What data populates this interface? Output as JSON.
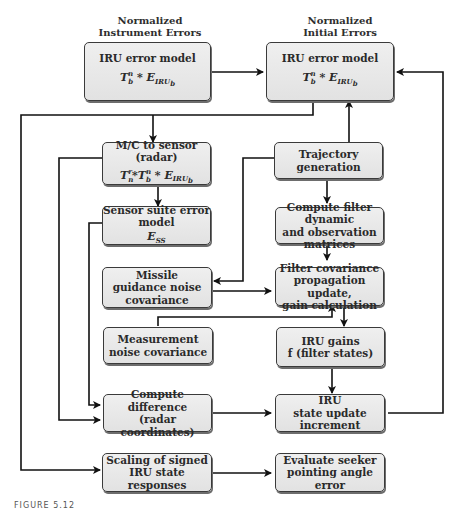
{
  "headers": {
    "left": [
      "Normalized",
      "Instrument Errors"
    ],
    "right": [
      "Normalized",
      "Initial Errors"
    ]
  },
  "boxes": {
    "iru_instrument": {
      "title": "IRU error model",
      "formula": "T_b^n * E_IRU_b"
    },
    "iru_initial": {
      "title": "IRU error model",
      "formula": "T_b^n * E_IRU_b"
    },
    "mc_sensor": {
      "title": "M/C to sensor (radar)",
      "formula": "T_n^r * T_b^n * E_IRU_b"
    },
    "trajectory": {
      "title": "Trajectory generation"
    },
    "sensor_suite": {
      "title": "Sensor suite error model",
      "formula": "E_SS"
    },
    "compute_filter": {
      "lines": [
        "Compute filter dynamic",
        "and observation matrices"
      ]
    },
    "missile_guidance": {
      "lines": [
        "Missile",
        "guidance noise",
        "covariance"
      ]
    },
    "filter_covariance": {
      "lines": [
        "Filter covariance",
        "propagation update,",
        "gain calculation"
      ]
    },
    "measurement_noise": {
      "lines": [
        "Measurement",
        "noise covariance"
      ]
    },
    "iru_gains": {
      "lines": [
        "IRU gains",
        "f (filter states)"
      ]
    },
    "compute_difference": {
      "lines": [
        "Compute difference",
        "(radar coordinates)"
      ]
    },
    "iru_state_update": {
      "lines": [
        "IRU",
        "state update increment"
      ]
    },
    "scaling": {
      "lines": [
        "Scaling of signed",
        "IRU state responses"
      ]
    },
    "evaluate_seeker": {
      "lines": [
        "Evaluate seeker",
        "pointing angle error"
      ]
    }
  },
  "caption": "FIGURE 5.12"
}
